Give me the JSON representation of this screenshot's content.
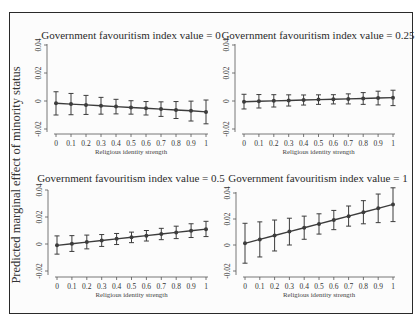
{
  "figure": {
    "ylabel": "Predicted marginal effect of minority status"
  },
  "chart_data": {
    "type": "line",
    "shared_ylabel": "Predicted marginal effect of minority status",
    "panels": [
      {
        "title": "Government favouritism index value = 0",
        "xlabel": "Religious identity strength",
        "ylabel": "Predicted marginal effect of minority status",
        "x": [
          0,
          0.1,
          0.2,
          0.3,
          0.4,
          0.5,
          0.6,
          0.7,
          0.8,
          0.9,
          1
        ],
        "x_tick_labels": [
          "0",
          "0.1",
          "0.2",
          "0.3",
          "0.4",
          "0.5",
          "0.6",
          "0.7",
          "0.8",
          "0.9",
          "1"
        ],
        "y": [
          -0.0016,
          -0.0022,
          -0.0028,
          -0.0034,
          -0.004,
          -0.0046,
          -0.0052,
          -0.0058,
          -0.0064,
          -0.007,
          -0.0078
        ],
        "ci_lower": [
          -0.01,
          -0.0098,
          -0.0096,
          -0.0094,
          -0.0092,
          -0.0094,
          -0.01,
          -0.011,
          -0.0125,
          -0.0143,
          -0.0163
        ],
        "ci_upper": [
          0.0066,
          0.0054,
          0.004,
          0.0026,
          0.0012,
          0.0002,
          -0.0004,
          -0.0006,
          -0.0004,
          -0.0001,
          0.0007
        ],
        "ylim": [
          -0.02,
          0.04
        ],
        "y_ticks": [
          -0.02,
          0,
          0.02,
          0.04
        ],
        "y_tick_labels": [
          "-0.02",
          "0",
          "0.02",
          "0.04"
        ]
      },
      {
        "title": "Government favouritism index value = 0.25",
        "xlabel": "Religious identity strength",
        "ylabel": "Predicted marginal effect of minority status",
        "x": [
          0,
          0.1,
          0.2,
          0.3,
          0.4,
          0.5,
          0.6,
          0.7,
          0.8,
          0.9,
          1
        ],
        "x_tick_labels": [
          "0",
          "0.1",
          "0.2",
          "0.3",
          "0.4",
          "0.5",
          "0.6",
          "0.7",
          "0.8",
          "0.9",
          "1"
        ],
        "y": [
          -0.0005,
          -0.0002,
          0.0001,
          0.0004,
          0.0007,
          0.001,
          0.0012,
          0.0015,
          0.0018,
          0.0021,
          0.0024
        ],
        "ci_lower": [
          -0.0057,
          -0.005,
          -0.0043,
          -0.0036,
          -0.0029,
          -0.0024,
          -0.0021,
          -0.0021,
          -0.0024,
          -0.0028,
          -0.0033
        ],
        "ci_upper": [
          0.0048,
          0.0046,
          0.0045,
          0.0044,
          0.0043,
          0.0044,
          0.0045,
          0.0051,
          0.006,
          0.007,
          0.0077
        ],
        "ylim": [
          -0.02,
          0.04
        ],
        "y_ticks": [
          -0.02,
          0,
          0.02,
          0.04
        ],
        "y_tick_labels": [
          "-0.02",
          "0",
          "0.02",
          "0.04"
        ]
      },
      {
        "title": "Government favouritism index value = 0.5",
        "xlabel": "Religious identity strength",
        "ylabel": "Predicted marginal effect of minority status",
        "x": [
          0,
          0.1,
          0.2,
          0.3,
          0.4,
          0.5,
          0.6,
          0.7,
          0.8,
          0.9,
          1
        ],
        "x_tick_labels": [
          "0",
          "0.1",
          "0.2",
          "0.3",
          "0.4",
          "0.5",
          "0.6",
          "0.7",
          "0.8",
          "0.9",
          "1"
        ],
        "y": [
          -0.001,
          0.0002,
          0.0014,
          0.0026,
          0.0038,
          0.005,
          0.0062,
          0.0074,
          0.0086,
          0.0098,
          0.011
        ],
        "ci_lower": [
          -0.0075,
          -0.0055,
          -0.0036,
          -0.0018,
          -0.0004,
          0.001,
          0.0022,
          0.0032,
          0.004,
          0.0048,
          0.0055
        ],
        "ci_upper": [
          0.006,
          0.0062,
          0.0066,
          0.007,
          0.0078,
          0.0088,
          0.01,
          0.0116,
          0.0132,
          0.015,
          0.0168
        ],
        "ylim": [
          -0.02,
          0.04
        ],
        "y_ticks": [
          -0.02,
          0,
          0.02,
          0.04
        ],
        "y_tick_labels": [
          "-0.02",
          "0",
          "0.02",
          "0.04"
        ]
      },
      {
        "title": "Government favouritism index value = 1",
        "xlabel": "Religious identity strength",
        "ylabel": "Predicted marginal effect of minority status",
        "x": [
          0,
          0.1,
          0.2,
          0.3,
          0.4,
          0.5,
          0.6,
          0.7,
          0.8,
          0.9,
          1
        ],
        "x_tick_labels": [
          "0",
          "0.1",
          "0.2",
          "0.3",
          "0.4",
          "0.5",
          "0.6",
          "0.7",
          "0.8",
          "0.9",
          "1"
        ],
        "y": [
          0.0013,
          0.0043,
          0.0073,
          0.0103,
          0.0133,
          0.0162,
          0.0192,
          0.0222,
          0.0252,
          0.0282,
          0.0312
        ],
        "ci_lower": [
          -0.014,
          -0.0092,
          -0.0046,
          0.0,
          0.0044,
          0.0084,
          0.0118,
          0.0145,
          0.0163,
          0.0172,
          0.018
        ],
        "ci_upper": [
          0.0167,
          0.0178,
          0.0192,
          0.0206,
          0.0222,
          0.024,
          0.0266,
          0.03,
          0.0341,
          0.0392,
          0.044
        ],
        "ylim": [
          -0.02,
          0.045
        ],
        "y_ticks": [
          -0.02,
          0,
          0.02,
          0.04
        ],
        "y_tick_labels": [
          "-0.02",
          "0",
          "0.02",
          "0.04"
        ]
      }
    ],
    "grid": false,
    "legend": null,
    "line_color": "#3c3c3c",
    "marker": "filled-circle"
  },
  "layout": {
    "panels": [
      {
        "x0": 56,
        "x1": 206,
        "y_zero": 101,
        "px_per_unit": 1400,
        "y_axis_top": 44,
        "y_axis_bottom": 132,
        "x_axis_y": 134,
        "axis_x": 47,
        "title_x": 131,
        "title_y": 39
      },
      {
        "x0": 244,
        "x1": 393,
        "y_zero": 101,
        "px_per_unit": 1400,
        "y_axis_top": 44,
        "y_axis_bottom": 132,
        "x_axis_y": 134,
        "axis_x": 235,
        "title_x": 318,
        "title_y": 39
      },
      {
        "x0": 57,
        "x1": 206,
        "y_zero": 244,
        "px_per_unit": 1350,
        "y_axis_top": 190,
        "y_axis_bottom": 275,
        "x_axis_y": 277,
        "axis_x": 48,
        "title_x": 131,
        "title_y": 182
      },
      {
        "x0": 245,
        "x1": 393,
        "y_zero": 245,
        "px_per_unit": 1300,
        "y_axis_top": 192,
        "y_axis_bottom": 275,
        "x_axis_y": 277,
        "axis_x": 236,
        "title_x": 318,
        "title_y": 182
      }
    ]
  }
}
